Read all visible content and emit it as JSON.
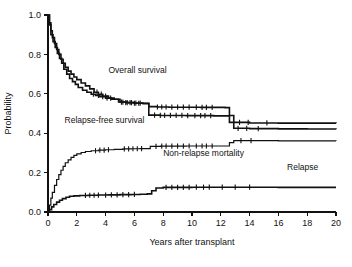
{
  "chart_data": {
    "type": "line",
    "title": "",
    "xlabel": "Years after transplant",
    "ylabel": "Probability",
    "xlim": [
      0,
      20
    ],
    "ylim": [
      0.0,
      1.0
    ],
    "xticks": [
      0,
      2,
      4,
      6,
      8,
      10,
      12,
      14,
      16,
      18,
      20
    ],
    "xticklabels": [
      "0",
      "2",
      "4",
      "6",
      "8",
      "10",
      "12",
      "14",
      "16",
      "18",
      "20"
    ],
    "yticks": [
      0.0,
      0.2,
      0.4,
      0.6,
      0.8,
      1.0
    ],
    "yticklabels": [
      "0.0",
      "0.2",
      "0.4",
      "0.6",
      "0.8",
      "1.0"
    ],
    "grid": false,
    "legend_position": "inline-annotations",
    "curve_style": "kaplan-meier step function with censoring tick marks",
    "series": [
      {
        "name": "Overall survival",
        "label": "Overall survival",
        "label_x": 4.2,
        "label_y": 0.705,
        "color": "#111111",
        "final_value": 0.45,
        "points": [
          [
            0.0,
            1.0
          ],
          [
            0.1,
            0.96
          ],
          [
            0.2,
            0.92
          ],
          [
            0.3,
            0.885
          ],
          [
            0.45,
            0.855
          ],
          [
            0.6,
            0.825
          ],
          [
            0.75,
            0.8
          ],
          [
            0.9,
            0.775
          ],
          [
            1.05,
            0.755
          ],
          [
            1.2,
            0.735
          ],
          [
            1.4,
            0.715
          ],
          [
            1.6,
            0.7
          ],
          [
            1.8,
            0.685
          ],
          [
            2.0,
            0.672
          ],
          [
            2.3,
            0.655
          ],
          [
            2.6,
            0.64
          ],
          [
            2.9,
            0.625
          ],
          [
            3.2,
            0.608
          ],
          [
            3.5,
            0.598
          ],
          [
            3.8,
            0.588
          ],
          [
            4.2,
            0.578
          ],
          [
            4.6,
            0.572
          ],
          [
            5.0,
            0.558
          ],
          [
            5.5,
            0.555
          ],
          [
            6.0,
            0.553
          ],
          [
            6.6,
            0.552
          ],
          [
            7.0,
            0.535
          ],
          [
            7.6,
            0.533
          ],
          [
            8.4,
            0.532
          ],
          [
            9.5,
            0.532
          ],
          [
            10.6,
            0.531
          ],
          [
            11.6,
            0.531
          ],
          [
            12.3,
            0.53
          ],
          [
            12.6,
            0.49
          ],
          [
            12.9,
            0.455
          ],
          [
            14.0,
            0.452
          ],
          [
            16.0,
            0.451
          ],
          [
            18.0,
            0.451
          ],
          [
            20.0,
            0.45
          ]
        ],
        "censor_x": [
          3.4,
          3.7,
          4.0,
          4.35,
          5.2,
          5.5,
          5.8,
          6.1,
          6.4,
          7.6,
          7.9,
          8.2,
          8.6,
          9.0,
          9.4,
          9.8,
          10.3,
          10.7,
          11.0,
          11.4,
          13.3,
          13.9,
          15.2
        ]
      },
      {
        "name": "Relapse-free survival",
        "label": "Relapse-free survival",
        "label_x": 1.15,
        "label_y": 0.452,
        "color": "#111111",
        "final_value": 0.42,
        "points": [
          [
            0.0,
            1.0
          ],
          [
            0.1,
            0.95
          ],
          [
            0.2,
            0.9
          ],
          [
            0.35,
            0.865
          ],
          [
            0.5,
            0.835
          ],
          [
            0.65,
            0.805
          ],
          [
            0.8,
            0.78
          ],
          [
            0.95,
            0.755
          ],
          [
            1.1,
            0.725
          ],
          [
            1.3,
            0.7
          ],
          [
            1.5,
            0.678
          ],
          [
            1.7,
            0.662
          ],
          [
            1.9,
            0.648
          ],
          [
            2.1,
            0.632
          ],
          [
            2.4,
            0.618
          ],
          [
            2.7,
            0.608
          ],
          [
            3.0,
            0.598
          ],
          [
            3.3,
            0.592
          ],
          [
            3.6,
            0.585
          ],
          [
            4.0,
            0.578
          ],
          [
            4.4,
            0.572
          ],
          [
            4.9,
            0.558
          ],
          [
            5.4,
            0.555
          ],
          [
            6.0,
            0.552
          ],
          [
            6.6,
            0.55
          ],
          [
            7.0,
            0.492
          ],
          [
            7.8,
            0.49
          ],
          [
            8.6,
            0.49
          ],
          [
            9.6,
            0.489
          ],
          [
            10.6,
            0.489
          ],
          [
            11.5,
            0.488
          ],
          [
            12.3,
            0.488
          ],
          [
            12.6,
            0.455
          ],
          [
            12.9,
            0.425
          ],
          [
            14.0,
            0.423
          ],
          [
            16.0,
            0.422
          ],
          [
            18.0,
            0.421
          ],
          [
            20.0,
            0.42
          ]
        ],
        "censor_x": [
          3.15,
          3.5,
          3.8,
          4.1,
          5.1,
          5.4,
          5.7,
          6.0,
          6.3,
          7.4,
          7.8,
          8.1,
          8.5,
          8.9,
          9.3,
          9.7,
          10.2,
          10.6,
          10.9,
          11.3,
          13.2,
          13.8,
          14.6
        ]
      },
      {
        "name": "Non-relapse mortality",
        "label": "Non-relapse mortality",
        "label_x": 8.0,
        "label_y": 0.283,
        "color": "#111111",
        "final_value": 0.36,
        "points": [
          [
            0.0,
            0.0
          ],
          [
            0.1,
            0.035
          ],
          [
            0.2,
            0.07
          ],
          [
            0.3,
            0.1
          ],
          [
            0.45,
            0.135
          ],
          [
            0.6,
            0.165
          ],
          [
            0.75,
            0.19
          ],
          [
            0.9,
            0.212
          ],
          [
            1.05,
            0.232
          ],
          [
            1.2,
            0.25
          ],
          [
            1.4,
            0.265
          ],
          [
            1.6,
            0.277
          ],
          [
            1.8,
            0.287
          ],
          [
            2.0,
            0.295
          ],
          [
            2.3,
            0.302
          ],
          [
            2.6,
            0.307
          ],
          [
            3.0,
            0.311
          ],
          [
            3.5,
            0.314
          ],
          [
            4.0,
            0.316
          ],
          [
            4.6,
            0.318
          ],
          [
            5.2,
            0.32
          ],
          [
            5.8,
            0.321
          ],
          [
            6.4,
            0.322
          ],
          [
            6.9,
            0.322
          ],
          [
            7.1,
            0.333
          ],
          [
            7.8,
            0.334
          ],
          [
            8.6,
            0.334
          ],
          [
            9.6,
            0.335
          ],
          [
            10.6,
            0.335
          ],
          [
            11.5,
            0.335
          ],
          [
            12.3,
            0.335
          ],
          [
            12.6,
            0.352
          ],
          [
            12.9,
            0.362
          ],
          [
            14.0,
            0.362
          ],
          [
            16.0,
            0.361
          ],
          [
            18.0,
            0.361
          ],
          [
            20.0,
            0.36
          ]
        ],
        "censor_x": [
          3.3,
          3.6,
          3.9,
          4.2,
          5.3,
          5.6,
          5.9,
          6.2,
          6.5,
          7.5,
          7.9,
          8.2,
          8.6,
          9.0,
          9.4,
          9.8,
          10.3,
          10.7,
          11.0,
          11.4,
          13.4,
          14.1
        ]
      },
      {
        "name": "Relapse",
        "label": "Relapse",
        "label_x": 16.6,
        "label_y": 0.215,
        "color": "#111111",
        "final_value": 0.125,
        "points": [
          [
            0.0,
            0.0
          ],
          [
            0.1,
            0.012
          ],
          [
            0.25,
            0.026
          ],
          [
            0.4,
            0.038
          ],
          [
            0.6,
            0.05
          ],
          [
            0.8,
            0.06
          ],
          [
            1.0,
            0.068
          ],
          [
            1.25,
            0.075
          ],
          [
            1.5,
            0.08
          ],
          [
            1.8,
            0.082
          ],
          [
            2.2,
            0.084
          ],
          [
            2.8,
            0.085
          ],
          [
            3.5,
            0.086
          ],
          [
            4.2,
            0.087
          ],
          [
            5.0,
            0.088
          ],
          [
            5.8,
            0.089
          ],
          [
            6.4,
            0.09
          ],
          [
            6.9,
            0.092
          ],
          [
            7.2,
            0.108
          ],
          [
            7.5,
            0.122
          ],
          [
            8.0,
            0.125
          ],
          [
            9.0,
            0.125
          ],
          [
            10.0,
            0.126
          ],
          [
            11.0,
            0.126
          ],
          [
            12.0,
            0.126
          ],
          [
            14.0,
            0.126
          ],
          [
            16.0,
            0.125
          ],
          [
            18.0,
            0.125
          ],
          [
            20.0,
            0.125
          ]
        ],
        "censor_x": [
          2.6,
          2.9,
          3.2,
          3.5,
          4.0,
          4.4,
          4.8,
          5.2,
          5.6,
          6.0,
          8.2,
          8.6,
          9.0,
          9.4,
          9.8,
          10.3,
          10.8,
          11.2,
          12.1,
          13.0,
          14.0
        ]
      }
    ]
  },
  "axes": {
    "ylabel": "Probability",
    "xlabel": "Years after transplant"
  }
}
